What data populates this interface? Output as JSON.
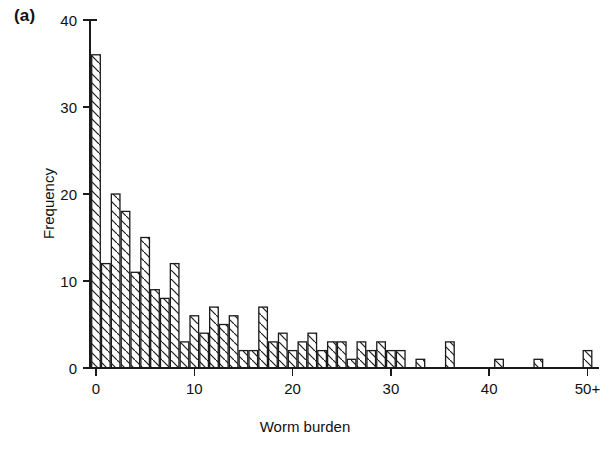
{
  "figure": {
    "panel_label": "(a)",
    "background": "#ffffff",
    "ink_color": "#1a1a1a"
  },
  "chart_data": {
    "type": "bar",
    "title": "",
    "subtitle": "",
    "panel": "(a)",
    "xlabel": "Worm burden",
    "ylabel": "Frequency",
    "xlim": [
      -0.6,
      51.2
    ],
    "ylim": [
      0,
      40
    ],
    "grid": false,
    "legend": null,
    "bar_style": "hatched-diagonal-open",
    "yticks": [
      0,
      10,
      20,
      30,
      40
    ],
    "ytick_labels": [
      "0",
      "10",
      "20",
      "30",
      "40"
    ],
    "xticks": [
      0,
      10,
      20,
      30,
      40,
      50
    ],
    "xtick_labels": [
      "0",
      "10",
      "20",
      "30",
      "40",
      "50+"
    ],
    "categories": [
      "0",
      "1",
      "2",
      "3",
      "4",
      "5",
      "6",
      "7",
      "8",
      "9",
      "10",
      "11",
      "12",
      "13",
      "14",
      "15",
      "16",
      "17",
      "18",
      "19",
      "20",
      "21",
      "22",
      "23",
      "24",
      "25",
      "26",
      "27",
      "28",
      "29",
      "30",
      "31",
      "32",
      "33",
      "34",
      "35",
      "36",
      "37",
      "38",
      "39",
      "40",
      "41",
      "42",
      "43",
      "44",
      "45",
      "46",
      "47",
      "48",
      "49",
      "50+"
    ],
    "values": [
      36,
      12,
      20,
      18,
      11,
      15,
      9,
      8,
      12,
      3,
      6,
      4,
      7,
      5,
      6,
      2,
      2,
      7,
      3,
      4,
      2,
      3,
      4,
      2,
      3,
      3,
      1,
      3,
      2,
      3,
      2,
      2,
      0,
      1,
      0,
      0,
      3,
      0,
      0,
      0,
      0,
      1,
      0,
      0,
      0,
      1,
      0,
      0,
      0,
      0,
      2
    ]
  }
}
